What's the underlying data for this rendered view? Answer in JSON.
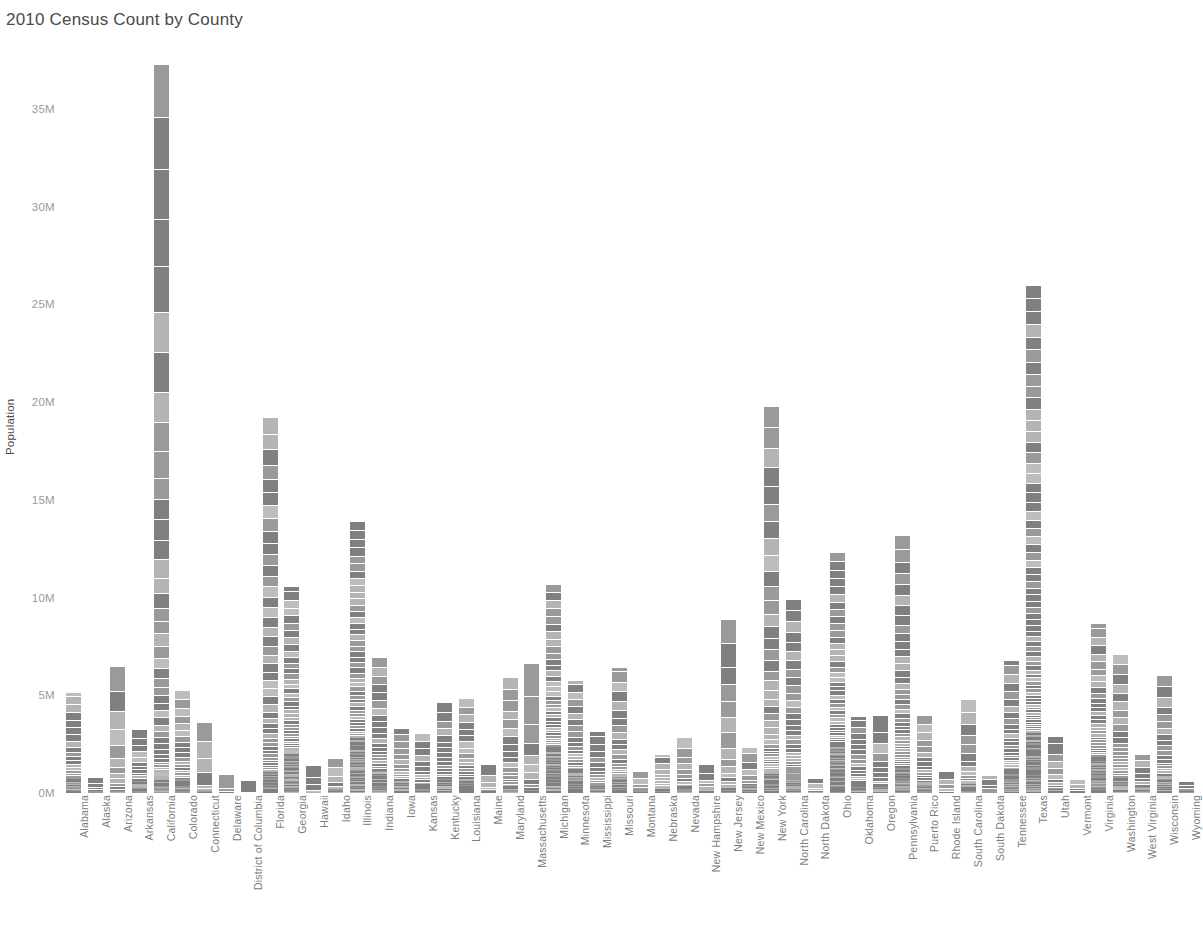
{
  "chart_data": {
    "type": "bar",
    "title": "2010 Census Count by County",
    "subtitle": "",
    "xlabel": "",
    "ylabel": "Population",
    "stacked": true,
    "grid": false,
    "legend": null,
    "ylim": [
      0,
      37500000
    ],
    "ytick_labels": [
      "0M",
      "5M",
      "10M",
      "15M",
      "20M",
      "25M",
      "30M",
      "35M"
    ],
    "ytick_values": [
      0,
      5000000,
      10000000,
      15000000,
      20000000,
      25000000,
      30000000,
      35000000
    ],
    "note": "Each bar is a stack of that state's county populations; segment count approximates the number of counties.",
    "bar_color": "#808080",
    "bar_color_light": "#bdbdbd",
    "categories": [
      "Alabama",
      "Alaska",
      "Arizona",
      "Arkansas",
      "California",
      "Colorado",
      "Connecticut",
      "Delaware",
      "District of Columbia",
      "Florida",
      "Georgia",
      "Hawaii",
      "Idaho",
      "Illinois",
      "Indiana",
      "Iowa",
      "Kansas",
      "Kentucky",
      "Louisiana",
      "Maine",
      "Maryland",
      "Massachusetts",
      "Michigan",
      "Minnesota",
      "Mississippi",
      "Missouri",
      "Montana",
      "Nebraska",
      "Nevada",
      "New Hampshire",
      "New Jersey",
      "New Mexico",
      "New York",
      "North Carolina",
      "North Dakota",
      "Ohio",
      "Oklahoma",
      "Oregon",
      "Pennsylvania",
      "Puerto Rico",
      "Rhode Island",
      "South Carolina",
      "South Dakota",
      "Tennessee",
      "Texas",
      "Utah",
      "Vermont",
      "Virginia",
      "Washington",
      "West Virginia",
      "Wisconsin",
      "Wyoming"
    ],
    "values": [
      4779736,
      710231,
      6392017,
      2915918,
      37253956,
      5029196,
      3574097,
      897934,
      601723,
      18801310,
      9687653,
      1360301,
      1567582,
      12830632,
      6483802,
      3046355,
      2853118,
      4339367,
      4533372,
      1328361,
      5773552,
      6547629,
      9883640,
      5303925,
      2967297,
      5988927,
      989415,
      1826341,
      2700551,
      1316470,
      8791894,
      2059179,
      19378102,
      9535483,
      672591,
      11536504,
      3751351,
      3831074,
      12702379,
      3725789,
      1052567,
      4625364,
      814180,
      6346105,
      25145561,
      2763885,
      625741,
      8001024,
      6724540,
      1852994,
      5686986,
      563626
    ],
    "counties": [
      67,
      29,
      15,
      75,
      58,
      64,
      8,
      3,
      1,
      67,
      159,
      5,
      44,
      102,
      92,
      99,
      105,
      120,
      64,
      16,
      24,
      14,
      83,
      87,
      82,
      115,
      56,
      93,
      17,
      10,
      21,
      33,
      62,
      100,
      53,
      88,
      77,
      36,
      67,
      78,
      5,
      46,
      66,
      95,
      254,
      29,
      14,
      133,
      39,
      55,
      72,
      23
    ]
  }
}
